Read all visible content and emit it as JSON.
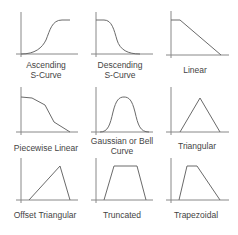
{
  "colors": {
    "axis": "#888888",
    "curve": "#6a6a6a",
    "text": "#444444",
    "background": "#ffffff"
  },
  "cells": [
    {
      "id": "ascending-s-curve",
      "label_lines": [
        "Ascending",
        "S-Curve"
      ]
    },
    {
      "id": "descending-s-curve",
      "label_lines": [
        "Descending",
        "S-Curve"
      ]
    },
    {
      "id": "linear",
      "label_lines": [
        "Linear"
      ]
    },
    {
      "id": "piecewise-linear",
      "label_lines": [
        "Piecewise Linear"
      ]
    },
    {
      "id": "gaussian-bell-curve",
      "label_lines": [
        "Gaussian or Bell",
        "Curve"
      ]
    },
    {
      "id": "triangular",
      "label_lines": [
        "Triangular"
      ]
    },
    {
      "id": "offset-triangular",
      "label_lines": [
        "Offset Triangular"
      ]
    },
    {
      "id": "truncated",
      "label_lines": [
        "Truncated"
      ]
    },
    {
      "id": "trapezoidal",
      "label_lines": [
        "Trapezoidal"
      ]
    }
  ]
}
